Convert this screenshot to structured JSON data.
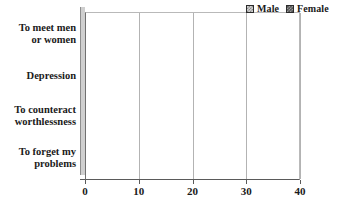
{
  "chart_data": {
    "type": "bar",
    "orientation": "horizontal",
    "title": "",
    "xlabel": "",
    "ylabel": "",
    "xlim": [
      0,
      40
    ],
    "xticks": [
      0,
      10,
      20,
      30,
      40
    ],
    "grid": true,
    "legend_position": "top-right",
    "categories": [
      "To meet men or women",
      "Depression",
      "To counteract worthlessness",
      "To forget my problems"
    ],
    "category_lines": [
      [
        "To meet men",
        "or women"
      ],
      [
        "Depression",
        ""
      ],
      [
        "To counteract",
        "worthlessness"
      ],
      [
        "To forget my",
        "problems"
      ]
    ],
    "series": [
      {
        "name": "Male",
        "values": [
          14.3,
          33.8,
          23.9,
          33.2
        ],
        "color": "#d4d4d4"
      },
      {
        "name": "Female",
        "values": [
          23.7,
          24.3,
          17.5,
          26.7
        ],
        "color": "#565656"
      }
    ]
  },
  "legend": {
    "entries": [
      {
        "label": "Male",
        "swatch": "male-swatch-icon"
      },
      {
        "label": "Female",
        "swatch": "female-swatch-icon"
      }
    ]
  },
  "axis": {
    "x_tick_labels": [
      "0",
      "10",
      "20",
      "30",
      "40"
    ]
  }
}
